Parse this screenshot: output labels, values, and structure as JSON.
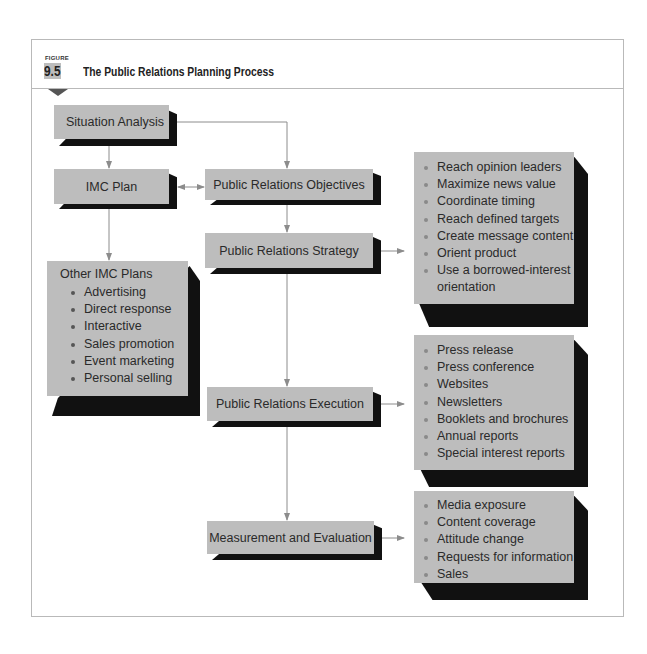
{
  "figure": {
    "label": "FIGURE",
    "number": "9.5",
    "title": "The Public Relations Planning Process"
  },
  "nodes": {
    "situation_analysis": "Situation Analysis",
    "imc_plan": "IMC Plan",
    "pr_objectives": "Public Relations Objectives",
    "pr_strategy": "Public Relations Strategy",
    "pr_execution": "Public Relations Execution",
    "measurement": "Measurement and Evaluation",
    "other_imc": {
      "title": "Other IMC Plans",
      "items": [
        "Advertising",
        "Direct response",
        "Interactive",
        "Sales promotion",
        "Event marketing",
        "Personal selling"
      ]
    },
    "strategy_list": {
      "items": [
        "Reach opinion leaders",
        "Maximize news value",
        "Coordinate timing",
        "Reach defined targets",
        "Create message content",
        "Orient product",
        "Use a borrowed-interest",
        "orientation"
      ]
    },
    "execution_list": {
      "items": [
        "Press release",
        "Press conference",
        "Websites",
        "Newsletters",
        "Booklets and brochures",
        "Annual reports",
        "Special interest reports"
      ]
    },
    "measurement_list": {
      "items": [
        "Media exposure",
        "Content coverage",
        "Attitude change",
        "Requests for information",
        "Sales"
      ]
    }
  },
  "colors": {
    "box_fill": "#bdbdbd",
    "box_shadow": "#111111",
    "connector": "#8c8c8c",
    "frame_border": "#b9b9b9"
  }
}
